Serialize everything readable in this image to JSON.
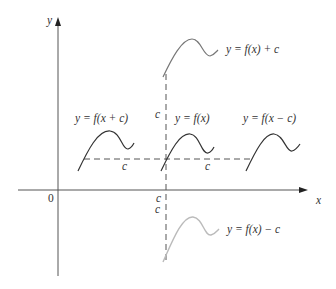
{
  "figure": {
    "axes": {
      "x_label": "x",
      "y_label": "y",
      "origin_label": "0",
      "c_tick_label": "c"
    },
    "curves": [
      {
        "id": "f",
        "label": "y = f(x)",
        "color": "#333333"
      },
      {
        "id": "f_plus_c",
        "label": "y = f(x) + c",
        "color": "#777777"
      },
      {
        "id": "f_minus_c",
        "label": "y = f(x) − c",
        "color": "#bbbbbb"
      },
      {
        "id": "f_x_plus_c",
        "label": "y = f(x + c)",
        "color": "#333333"
      },
      {
        "id": "f_x_minus_c",
        "label": "y = f(x − c)",
        "color": "#333333"
      }
    ],
    "shift_labels": {
      "vertical_up": "c",
      "vertical_down": "c",
      "horizontal_left": "c",
      "horizontal_right": "c"
    },
    "colors": {
      "axis": "#555555",
      "dashed": "#555555",
      "text": "#333333"
    }
  }
}
